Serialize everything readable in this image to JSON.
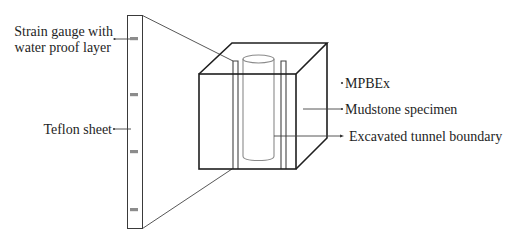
{
  "figure": {
    "type": "schematic",
    "colors": {
      "line": "#1f1f1f",
      "gauge_fill": "#8c8c8c",
      "cylinder_line": "#8a8a8a",
      "background": "#ffffff"
    }
  },
  "labels": {
    "strain_gauge_line1": "Strain gauge with",
    "strain_gauge_line2": "water proof layer",
    "teflon_sheet": "Teflon sheet",
    "mpbex": "MPBEx",
    "mudstone_specimen": "Mudstone specimen",
    "excavated_tunnel_boundary": "Excavated tunnel boundary"
  },
  "teflon_sheet": {
    "strain_gauge_count": 4
  }
}
